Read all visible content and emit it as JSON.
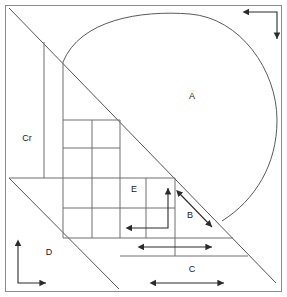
{
  "figure": {
    "width": 287,
    "height": 297,
    "background_color": "#ffffff",
    "line_color": "#6f6f6f",
    "arrow_color": "#2b2b2b",
    "label_color": "#1a1a1a"
  },
  "labels": {
    "a": "A",
    "b": "B",
    "c": "C",
    "d": "D",
    "e": "E",
    "cr": "Cr"
  },
  "label_positions": {
    "a": {
      "x": 192,
      "y": 97
    },
    "b": {
      "x": 190,
      "y": 216
    },
    "c": {
      "x": 192,
      "y": 270
    },
    "d": {
      "x": 49,
      "y": 253
    },
    "e": {
      "x": 134,
      "y": 190
    },
    "cr": {
      "x": 27,
      "y": 139
    }
  },
  "geometry": {
    "outer_frame": {
      "x": 5,
      "y": 5,
      "width": 277,
      "height": 287
    },
    "main_diagonal": {
      "x1": 9,
      "y1": 8,
      "x2": 276,
      "y2": 283
    },
    "lower_diagonal": {
      "x1": 9,
      "y1": 178,
      "x2": 119,
      "y2": 289
    },
    "teardrop_tip": {
      "x": 222,
      "y": 221
    },
    "teardrop_apex": {
      "x": 190,
      "y": 14
    },
    "vertical_lines": [
      {
        "x": 44,
        "y1": 42,
        "y2": 178
      },
      {
        "x": 63,
        "y1": 62,
        "y2": 238
      },
      {
        "x": 92,
        "y1": 120,
        "y2": 238
      },
      {
        "x": 120,
        "y1": 120,
        "y2": 238
      },
      {
        "x": 146,
        "y1": 178,
        "y2": 238
      },
      {
        "x": 175,
        "y1": 178,
        "y2": 256
      }
    ],
    "horizontal_lines": [
      {
        "y": 120,
        "x1": 63,
        "x2": 120
      },
      {
        "y": 148,
        "x1": 63,
        "x2": 120
      },
      {
        "y": 178,
        "x1": 9,
        "x2": 175
      },
      {
        "y": 208,
        "x1": 63,
        "x2": 175
      },
      {
        "y": 238,
        "x1": 63,
        "x2": 233
      },
      {
        "y": 256,
        "x1": 120,
        "x2": 248
      }
    ]
  },
  "dimension_arrows": [
    {
      "name": "top-right-corner-arrow",
      "type": "elbow",
      "description": "horizontal leg pointing left then vertical leg pointing down",
      "points": "248,12 277,12 277,39",
      "head_start": "left",
      "head_end": "down"
    },
    {
      "name": "b-diagonal-arrow",
      "type": "double",
      "description": "double headed arrow parallel to main diagonal labelled B",
      "x1": 180,
      "y1": 194,
      "x2": 212,
      "y2": 227
    },
    {
      "name": "e-elbow-arrow",
      "type": "elbow",
      "description": "vertical leg pointing up and horizontal leg pointing left inside block E",
      "points": "168,188 168,228 131,228",
      "head_start": "up",
      "head_end": "left"
    },
    {
      "name": "upper-c-arrow",
      "type": "double",
      "description": "horizontal double headed arrow above label C",
      "x1": 143,
      "y1": 247,
      "x2": 212,
      "y2": 247
    },
    {
      "name": "lower-c-arrow",
      "type": "double",
      "description": "horizontal double headed arrow below label C",
      "x1": 155,
      "y1": 283,
      "x2": 224,
      "y2": 283
    },
    {
      "name": "d-axis-arrows",
      "type": "axes",
      "description": "origin axes with vertical arrow up and horizontal arrow right near label D",
      "origin_x": 18,
      "origin_y": 283,
      "up_y": 245,
      "right_x": 46
    }
  ]
}
